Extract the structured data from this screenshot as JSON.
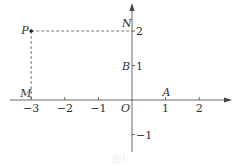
{
  "diagram": {
    "type": "coordinate-plane",
    "x_axis": {
      "ticks": [
        -3,
        -2,
        -1,
        1,
        2
      ],
      "tick_labels": [
        "−3",
        "−2",
        "−1",
        "1",
        "2"
      ]
    },
    "y_axis": {
      "ticks": [
        -1,
        1,
        2
      ],
      "tick_labels": [
        "−1",
        "1",
        "2"
      ]
    },
    "origin_label": "O",
    "points": [
      {
        "name": "P",
        "x": -3,
        "y": 2,
        "marked": true
      },
      {
        "name": "M",
        "x": -3,
        "y": 0,
        "marked": false
      },
      {
        "name": "N",
        "x": 0,
        "y": 2,
        "marked": false
      },
      {
        "name": "A",
        "x": 1,
        "y": 0,
        "marked": false
      },
      {
        "name": "B",
        "x": 0,
        "y": 1,
        "marked": false
      }
    ],
    "dashed_segments": [
      [
        "P",
        "M"
      ],
      [
        "P",
        "N"
      ]
    ],
    "caption": "图1"
  },
  "colors": {
    "ink": "#333333",
    "dash": "#555555"
  }
}
